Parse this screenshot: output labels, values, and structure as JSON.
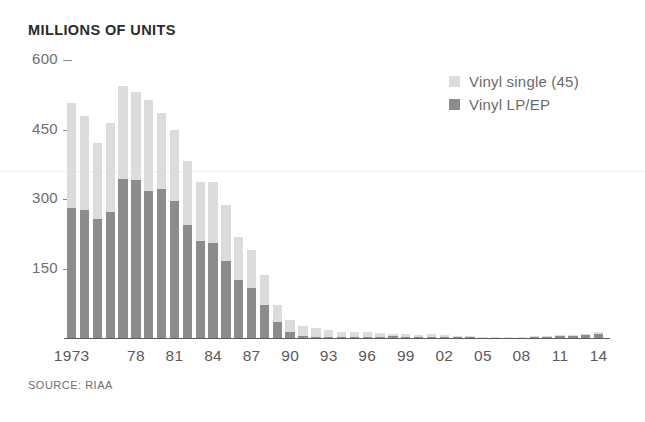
{
  "chart": {
    "title": "MILLIONS OF UNITS",
    "source_note": "SOURCE: RIAA"
  },
  "legend": {
    "position": "top-right",
    "entries": [
      {
        "label": "Vinyl single (45)",
        "color": "#dcdcdc",
        "swatch_name": "legend-swatch-vinyl-single"
      },
      {
        "label": "Vinyl LP/EP",
        "color": "#8c8c8c",
        "swatch_name": "legend-swatch-vinyl-lp-ep"
      }
    ]
  },
  "axes": {
    "y_ticks": [
      600,
      450,
      300,
      150
    ],
    "y_tick_labels": [
      "600",
      "450",
      "300",
      "150"
    ],
    "ylim": [
      0,
      600
    ],
    "x_tick_labels": [
      "1973",
      "78",
      "81",
      "84",
      "87",
      "90",
      "93",
      "96",
      "99",
      "02",
      "05",
      "08",
      "11",
      "14"
    ],
    "x_tick_years": [
      1973,
      1978,
      1981,
      1984,
      1987,
      1990,
      1993,
      1996,
      1999,
      2002,
      2005,
      2008,
      2011,
      2014
    ],
    "grid": "single faint horizontal gridline near 360"
  },
  "chart_data": {
    "type": "bar",
    "subtype": "stacked",
    "title": "MILLIONS OF UNITS",
    "xlabel": "",
    "ylabel": "Millions of units",
    "ylim": [
      0,
      600
    ],
    "yticks": [
      150,
      300,
      450,
      600
    ],
    "categories": [
      "1973",
      "1974",
      "1975",
      "1976",
      "1977",
      "1978",
      "1979",
      "1980",
      "1981",
      "1982",
      "1983",
      "1984",
      "1985",
      "1986",
      "1987",
      "1988",
      "1989",
      "1990",
      "1991",
      "1992",
      "1993",
      "1994",
      "1995",
      "1996",
      "1997",
      "1998",
      "1999",
      "2000",
      "2001",
      "2002",
      "2003",
      "2004",
      "2005",
      "2006",
      "2007",
      "2008",
      "2009",
      "2010",
      "2011",
      "2012",
      "2013",
      "2014"
    ],
    "series": [
      {
        "name": "Vinyl LP/EP",
        "color": "#8c8c8c",
        "values": [
          280,
          276,
          257,
          273,
          344,
          341,
          318,
          322,
          295,
          244,
          210,
          205,
          167,
          125,
          107,
          72,
          35,
          12,
          4.8,
          2.3,
          1.2,
          1.9,
          2.2,
          2.9,
          2.7,
          3.4,
          2.9,
          2.2,
          2.3,
          1.7,
          1.5,
          1.4,
          1.0,
          0.9,
          1.3,
          1.9,
          2.5,
          2.8,
          3.9,
          4.6,
          6.1,
          9.2
        ]
      },
      {
        "name": "Vinyl single (45)",
        "color": "#dcdcdc",
        "values": [
          228,
          204,
          164,
          190,
          200,
          190,
          195,
          164,
          154,
          137,
          127,
          132,
          120,
          93,
          82,
          65,
          36.6,
          27.6,
          22,
          19.8,
          15.1,
          11.7,
          10.2,
          10,
          7.5,
          5.4,
          5.3,
          4.8,
          5.5,
          4.4,
          2.1,
          1.9,
          1.3,
          1.1,
          1.1,
          1.1,
          1.2,
          1.4,
          1.7,
          2.1,
          2.6,
          3.9
        ]
      }
    ],
    "totals": [
      508,
      480,
      421,
      463,
      544,
      531,
      513,
      486,
      449,
      381,
      337,
      337,
      287,
      218,
      189,
      137,
      71.6,
      39.6,
      26.8,
      22.1,
      16.3,
      13.6,
      12.4,
      12.9,
      10.2,
      8.8,
      8.2,
      7.0,
      7.8,
      6.1,
      3.6,
      3.3,
      2.3,
      2.0,
      2.4,
      3.0,
      3.7,
      4.2,
      5.6,
      6.7,
      8.7,
      13.1
    ],
    "annotations": [],
    "source": "SOURCE: RIAA"
  },
  "colors": {
    "vinyl_single": "#dcdcdc",
    "vinyl_lp_ep": "#8c8c8c",
    "axis": "#5d5d5d",
    "tick_text": "#5a5a5a",
    "title_text": "#2b2b2b",
    "grid": "#ededed",
    "background": "#ffffff"
  }
}
